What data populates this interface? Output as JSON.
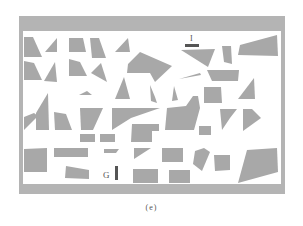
{
  "figure": {
    "caption": "(e)",
    "colors": {
      "background": "#ffffff",
      "frame": "#b4b4b4",
      "obstacle": "#a8a8a8",
      "marker": "#555555",
      "label": "#555555"
    },
    "frame": {
      "outer": [
        19,
        16,
        285,
        194
      ],
      "inner": [
        23,
        31,
        281,
        184
      ]
    },
    "markers": [
      {
        "id": "start",
        "label": "I",
        "label_pos": [
          191,
          40
        ],
        "shape": "horizontal-bar",
        "rect": [
          185,
          44,
          14,
          3
        ]
      },
      {
        "id": "goal",
        "label": "G",
        "label_pos": [
          106,
          176
        ],
        "shape": "vertical-bar",
        "rect": [
          115,
          166,
          3,
          14
        ]
      }
    ],
    "obstacles": [
      "24,37 33,37 42,57 24,57",
      "45,52 57,38 57,52",
      "69,38 83,38 86,52 69,52",
      "90,38 99,38 106,58 92,58",
      "115,52 128,38 130,52",
      "240,45 277,35 278,56 238,55",
      "181,50 215,49 208,67",
      "222,46 231,46 232,64 224,62",
      "24,61 34,63 42,80 24,80",
      "44,81 55,62 57,82",
      "69,59 80,62 87,76 69,76",
      "91,73 101,63 107,82",
      "128,64 140,52 172,66 155,82 150,73 127,73",
      "179,79 200,73 201,75",
      "207,70 239,70 238,81 212,81",
      "79,95 87,91 92,95",
      "115,99 124,77 130,99",
      "150,85 155,97 157,103 151,101",
      "174,86 178,100 172,101",
      "204,87 221,87 222,103 204,103",
      "238,99 254,78 255,99",
      "24,117 34,113 38,116 24,130",
      "36,113 48,93 49,130 36,130",
      "54,112 66,114 72,130 55,130",
      "80,108 103,108 93,130 81,130",
      "112,108 160,108 131,118 112,130",
      "167,108 186,106 193,96 198,96 200,108 194,130 165,130",
      "132,124 159,124 159,131 152,131 152,142 131,142",
      "199,126 211,126 211,135 199,135",
      "220,109 237,109 230,118 222,130",
      "243,109 252,109 261,118 243,131",
      "80,134 95,134 95,142 80,142",
      "100,134 115,134 115,142 100,142",
      "24,149 47,148 47,172 24,172",
      "54,148 88,148 88,157 54,157",
      "104,149 119,149 116,153 104,153",
      "134,148 151,148 134,159",
      "162,148 183,148 183,162 162,162",
      "195,151 204,148 210,152 202,171 193,164",
      "214,155 230,155 230,170 215,171",
      "247,150 277,148 278,172 238,183",
      "66,166 89,170 89,179 65,178",
      "133,169 158,169 158,183 133,183",
      "169,170 190,170 190,183 169,183"
    ]
  }
}
